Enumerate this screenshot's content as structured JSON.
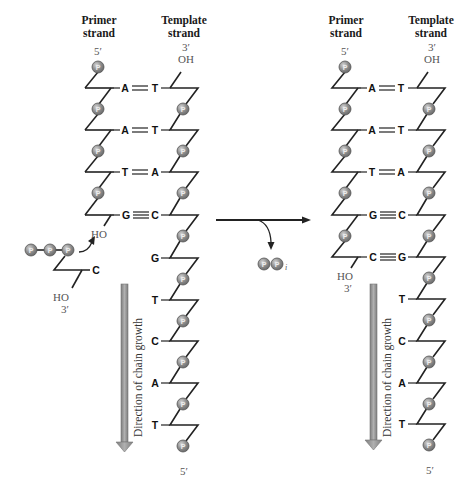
{
  "left_panel": {
    "primer_header": [
      "Primer",
      "strand"
    ],
    "template_header": [
      "Template",
      "strand"
    ],
    "primer_5prime": "5′",
    "template_3prime": "3′",
    "template_oh": "OH",
    "primer_3prime_oh": "HO",
    "template_5prime": "5′",
    "pairs": [
      {
        "primer": "A",
        "bond": "double",
        "template": "T"
      },
      {
        "primer": "A",
        "bond": "double",
        "template": "T"
      },
      {
        "primer": "T",
        "bond": "double",
        "template": "A"
      },
      {
        "primer": "G",
        "bond": "triple",
        "template": "C"
      }
    ],
    "unpaired_template": [
      "G",
      "T",
      "C",
      "A",
      "T"
    ],
    "incoming_nucleotide": {
      "phosphates": [
        "P",
        "P",
        "P"
      ],
      "base": "C",
      "oh": "HO",
      "end": "3′"
    },
    "direction_label": "Direction of chain growth"
  },
  "reaction": {
    "byproduct": "PP",
    "byproduct_subscript": "i"
  },
  "right_panel": {
    "primer_header": [
      "Primer",
      "strand"
    ],
    "template_header": [
      "Template",
      "strand"
    ],
    "primer_5prime": "5′",
    "template_3prime": "3′",
    "template_oh": "OH",
    "primer_3prime_oh": "HO",
    "primer_3prime_end": "3′",
    "template_5prime": "5′",
    "pairs": [
      {
        "primer": "A",
        "bond": "double",
        "template": "T"
      },
      {
        "primer": "A",
        "bond": "double",
        "template": "T"
      },
      {
        "primer": "T",
        "bond": "double",
        "template": "A"
      },
      {
        "primer": "G",
        "bond": "triple",
        "template": "C"
      },
      {
        "primer": "C",
        "bond": "triple",
        "template": "G"
      }
    ],
    "unpaired_template": [
      "T",
      "C",
      "A",
      "T"
    ],
    "direction_label": "Direction of chain growth"
  },
  "phosphate_label": "P",
  "colors": {
    "phosphate_fill": "#8c8c8c",
    "arrow_fill": "#9a9a9a",
    "line": "#222222"
  }
}
